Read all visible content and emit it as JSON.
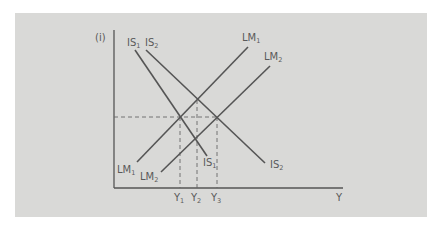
{
  "diagram": {
    "y_axis_label": "(i)",
    "x_axis_label": "Y",
    "curves": [
      {
        "name": "IS1",
        "label_main": "IS",
        "label_sub": "1",
        "type": "downward",
        "role": "IS curve (initial)"
      },
      {
        "name": "IS2",
        "label_main": "IS",
        "label_sub": "2",
        "type": "downward",
        "role": "IS curve (shifted)"
      },
      {
        "name": "LM1",
        "label_main": "LM",
        "label_sub": "1",
        "type": "upward",
        "role": "LM curve (initial)"
      },
      {
        "name": "LM2",
        "label_main": "LM",
        "label_sub": "2",
        "type": "upward",
        "role": "LM curve (shifted)"
      }
    ],
    "x_markers": [
      {
        "label_main": "Y",
        "label_sub": "1"
      },
      {
        "label_main": "Y",
        "label_sub": "2"
      },
      {
        "label_main": "Y",
        "label_sub": "3"
      }
    ],
    "colors": {
      "background": "#d9d9d7",
      "line": "#555555",
      "text": "#5a5a5a"
    }
  }
}
